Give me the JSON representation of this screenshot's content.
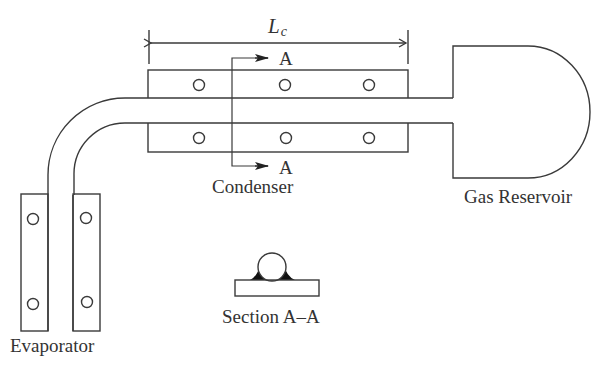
{
  "diagram": {
    "labels": {
      "length_symbol": "L",
      "length_subscript": "c",
      "section_marker_top": "A",
      "section_marker_bottom": "A",
      "condenser": "Condenser",
      "gas_reservoir": "Gas Reservoir",
      "evaporator": "Evaporator",
      "section": "Section A–A"
    },
    "components": [
      "evaporator",
      "pipe",
      "condenser",
      "gas-reservoir",
      "section-a-a"
    ],
    "colors": {
      "line": "#3a3a3a",
      "fillet": "#111111",
      "text": "#333333",
      "background": "#ffffff"
    }
  }
}
